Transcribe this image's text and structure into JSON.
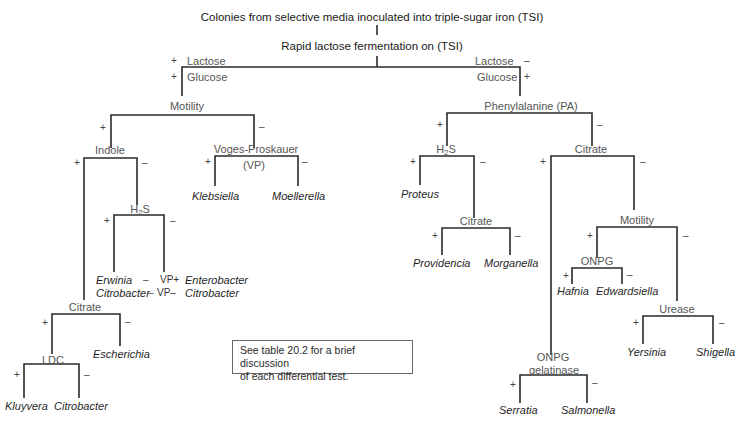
{
  "title": "Colonies from selective media inoculated into triple-sugar iron (TSI)",
  "subtitle": "Rapid lactose fermentation on (TSI)",
  "signs": {
    "plus": "+",
    "minus": "–"
  },
  "root_branches": {
    "left": {
      "lactose": "Lactose",
      "lactose_sign": "+",
      "glucose": "Glucose",
      "glucose_sign": "+"
    },
    "right": {
      "lactose": "Lactose",
      "lactose_sign": "–",
      "glucose": "Glucose",
      "glucose_sign": "+"
    }
  },
  "tests": {
    "motility_left": "Motility",
    "indole": "Indole",
    "voges_proskauer": "Voges-Proskauer",
    "vp_abbrev": "(VP)",
    "h2s_left": "H",
    "h2s_sub": "2",
    "h2s_tail": "S",
    "citrate_left": "Citrate",
    "ldc": "LDC",
    "phenylalanine": "Phenylalanine (PA)",
    "h2s_right": "H",
    "citrate_mid": "Citrate",
    "citrate_right": "Citrate",
    "motility_right": "Motility",
    "onpg": "ONPG",
    "urease": "Urease",
    "onpg_gelatinase_1": "ONPG",
    "onpg_gelatinase_2": "gelatinase"
  },
  "organisms": {
    "klebsiella": "Klebsiella",
    "moellerella": "Moellerella",
    "erwinia": "Erwinia",
    "citrobacter_h2s": "Citrobacter",
    "erwinia_sign": "–",
    "citrobacter_sign": "–",
    "vp_plus": "VP+",
    "vp_minus": "VP–",
    "enterobacter": "Enterobacter",
    "citrobacter_vp": "Citrobacter",
    "escherichia": "Escherichia",
    "kluyvera": "Kluyvera",
    "citrobacter_ldc": "Citrobacter",
    "proteus": "Proteus",
    "providencia": "Providencia",
    "morganella": "Morganella",
    "hafnia": "Hafnia",
    "edwardsiella": "Edwardsiella",
    "yersinia": "Yersinia",
    "shigella": "Shigella",
    "serratia": "Serratia",
    "salmonella": "Salmonella"
  },
  "note": {
    "line1": "See table 20.2 for a brief discussion",
    "line2": "of each differential test."
  },
  "colors": {
    "line": "#2a2a2a",
    "test_label": "#555555",
    "organism": "#1f1f1f"
  }
}
